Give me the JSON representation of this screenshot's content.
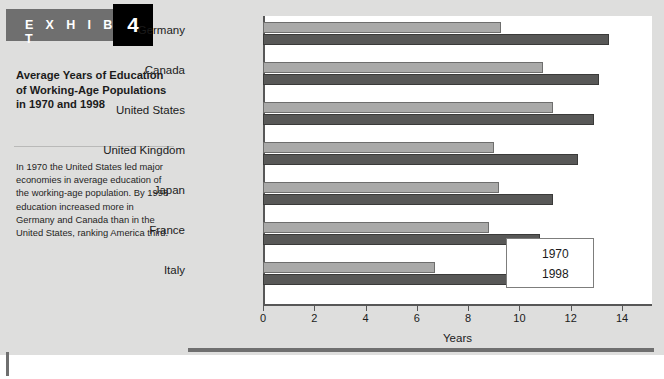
{
  "exhibit": {
    "banner_label": "E X H I B I T",
    "number": "4",
    "title": "Average Years of Education of Working-Age Populations in 1970 and 1998",
    "body": "In 1970 the United States led major economies in average education of the working-age population. By 1998 education increased more in Germany and Canada than in the United States, ranking America third."
  },
  "colors": {
    "banner_gray": "#6f6f6f",
    "panel_gray": "#dededd",
    "series_1970": "#a9a9a8",
    "series_1998": "#585857",
    "axis": "#575757",
    "plot_background": "#ffffff"
  },
  "chart_data": {
    "type": "bar",
    "orientation": "horizontal",
    "title": "Average Years of Education of Working-Age Populations in 1970 and 1998",
    "categories": [
      "Germany",
      "Canada",
      "United States",
      "United Kingdom",
      "Japan",
      "France",
      "Italy"
    ],
    "series": [
      {
        "name": "1970",
        "values": [
          9.3,
          10.9,
          11.3,
          9.0,
          9.2,
          8.8,
          6.7
        ]
      },
      {
        "name": "1998",
        "values": [
          13.5,
          13.1,
          12.9,
          12.3,
          11.3,
          10.8,
          9.5
        ]
      }
    ],
    "xlabel": "Years",
    "ylabel": "",
    "xlim": [
      0,
      14
    ],
    "xticks": [
      0,
      2,
      4,
      6,
      8,
      10,
      12,
      14
    ],
    "xtick_labels": [
      "0",
      "2",
      "4",
      "6",
      "8",
      "10",
      "12",
      "14"
    ],
    "grid": false,
    "legend_position": "inside-bottom-right",
    "legend_entries": [
      "1970",
      "1998"
    ]
  }
}
